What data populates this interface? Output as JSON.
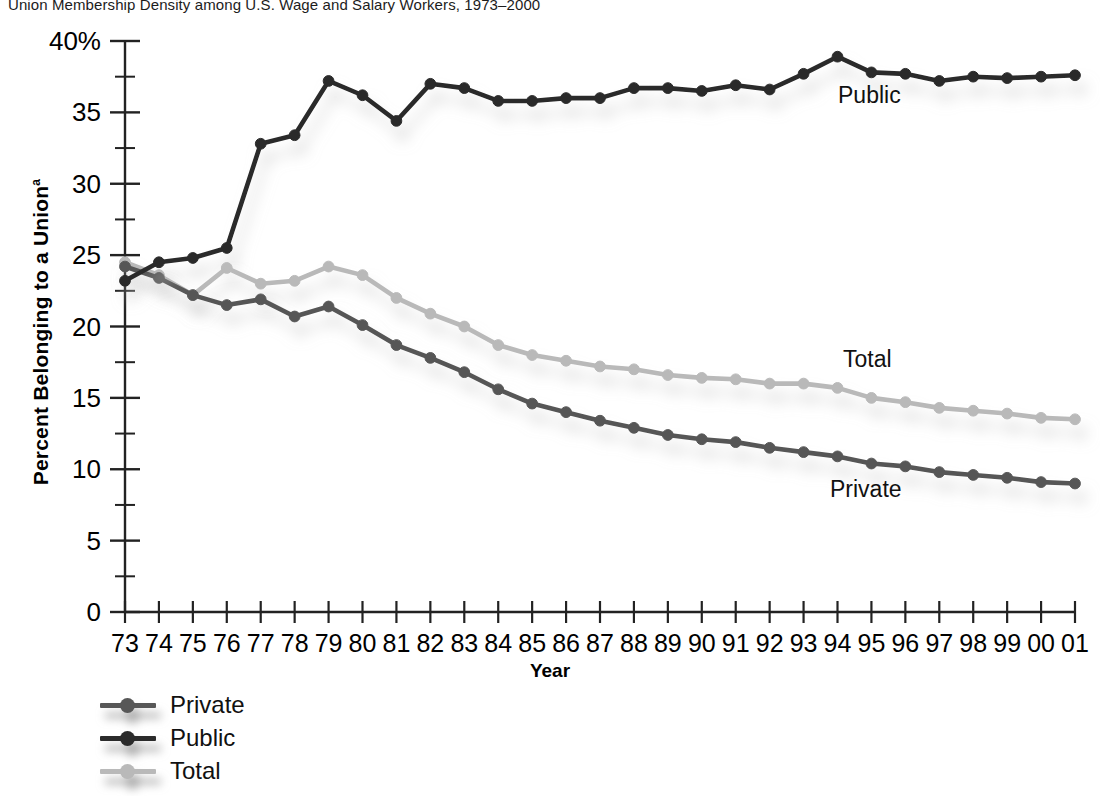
{
  "title": "Union Membership Density among U.S. Wage and Salary Workers, 1973–2000",
  "axes": {
    "ylabel_main": "Percent Belonging to a Union",
    "ylabel_superscript": "a",
    "xlabel": "Year",
    "ytick_labels": [
      "40%",
      "35",
      "30",
      "25",
      "20",
      "15",
      "10",
      "5",
      "0"
    ],
    "xtick_labels": [
      "73",
      "74",
      "75",
      "76",
      "77",
      "78",
      "79",
      "80",
      "81",
      "82",
      "83",
      "84",
      "85",
      "86",
      "87",
      "88",
      "89",
      "90",
      "91",
      "92",
      "93",
      "94",
      "95",
      "96",
      "97",
      "98",
      "99",
      "00",
      "01"
    ]
  },
  "annotations": {
    "public": "Public",
    "total": "Total",
    "private": "Private"
  },
  "legend": {
    "items": [
      {
        "label": "Private",
        "color": "#575757"
      },
      {
        "label": "Public",
        "color": "#2b2b2b"
      },
      {
        "label": "Total",
        "color": "#b9b9b9"
      }
    ]
  },
  "chart_data": {
    "type": "line",
    "title": "Union Membership Density among U.S. Wage and Salary Workers, 1973–2000",
    "xlabel": "Year",
    "ylabel": "Percent Belonging to a Union",
    "grid": false,
    "legend_position": "below-left",
    "ylim": [
      0,
      40
    ],
    "ytick_step": 5,
    "yminor_tick_step": 2.5,
    "categories": [
      "73",
      "74",
      "75",
      "76",
      "77",
      "78",
      "79",
      "80",
      "81",
      "82",
      "83",
      "84",
      "85",
      "86",
      "87",
      "88",
      "89",
      "90",
      "91",
      "92",
      "93",
      "94",
      "95",
      "96",
      "97",
      "98",
      "99",
      "00",
      "01"
    ],
    "series": [
      {
        "name": "Public",
        "color": "#2b2b2b",
        "values": [
          23.2,
          24.5,
          24.8,
          25.5,
          32.8,
          33.4,
          37.2,
          36.2,
          34.4,
          37.0,
          36.7,
          35.8,
          35.8,
          36.0,
          36.0,
          36.7,
          36.7,
          36.5,
          36.9,
          36.6,
          37.7,
          38.9,
          37.8,
          37.7,
          37.2,
          37.5,
          37.4,
          37.5,
          37.6
        ]
      },
      {
        "name": "Private",
        "color": "#575757",
        "values": [
          24.2,
          23.4,
          22.2,
          21.5,
          21.9,
          20.7,
          21.4,
          20.1,
          18.7,
          17.8,
          16.8,
          15.6,
          14.6,
          14.0,
          13.4,
          12.9,
          12.4,
          12.1,
          11.9,
          11.5,
          11.2,
          10.9,
          10.4,
          10.2,
          9.8,
          9.6,
          9.4,
          9.1,
          9.0
        ]
      },
      {
        "name": "Total",
        "color": "#b9b9b9",
        "values": [
          24.5,
          23.6,
          22.2,
          24.1,
          23.0,
          23.2,
          24.2,
          23.6,
          22.0,
          20.9,
          20.0,
          18.7,
          18.0,
          17.6,
          17.2,
          17.0,
          16.6,
          16.4,
          16.3,
          16.0,
          16.0,
          15.7,
          15.0,
          14.7,
          14.3,
          14.1,
          13.9,
          13.6,
          13.5
        ]
      }
    ]
  },
  "geometry": {
    "plot_left": 125,
    "plot_right": 1075,
    "y_zero_px": 612,
    "px_per_unit": 14.275,
    "annot_public": {
      "x": 838,
      "y": 103
    },
    "annot_total": {
      "x": 843,
      "y": 367
    },
    "annot_private": {
      "x": 830,
      "y": 497
    }
  }
}
